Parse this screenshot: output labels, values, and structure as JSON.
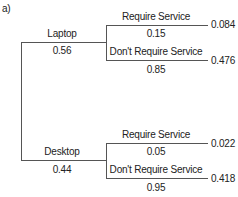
{
  "part_label": "a)",
  "tree": {
    "laptop": {
      "label": "Laptop",
      "prob": "0.56",
      "branches": [
        {
          "label": "Require Service",
          "prob": "0.15",
          "joint": "0.084"
        },
        {
          "label": "Don't Require Service",
          "prob": "0.85",
          "joint": "0.476"
        }
      ]
    },
    "desktop": {
      "label": "Desktop",
      "prob": "0.44",
      "branches": [
        {
          "label": "Require Service",
          "prob": "0.05",
          "joint": "0.022"
        },
        {
          "label": "Don't Require Service",
          "prob": "0.95",
          "joint": "0.418"
        }
      ]
    }
  }
}
